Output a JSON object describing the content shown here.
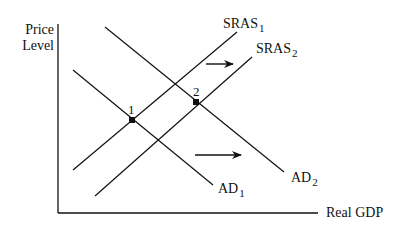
{
  "diagram": {
    "title": "",
    "y_axis_label_line1": "Price",
    "y_axis_label_line2": "Level",
    "x_axis_label": "Real GDP",
    "curves": [
      {
        "name": "SRAS",
        "sub": "1"
      },
      {
        "name": "SRAS",
        "sub": "2"
      },
      {
        "name": "AD",
        "sub": "1"
      },
      {
        "name": "AD",
        "sub": "2"
      }
    ],
    "points": [
      {
        "label": "1"
      },
      {
        "label": "2"
      }
    ],
    "arrows": [
      {
        "description": "SRAS shifts right"
      },
      {
        "description": "AD shifts right"
      }
    ],
    "line_color": "#111111"
  }
}
